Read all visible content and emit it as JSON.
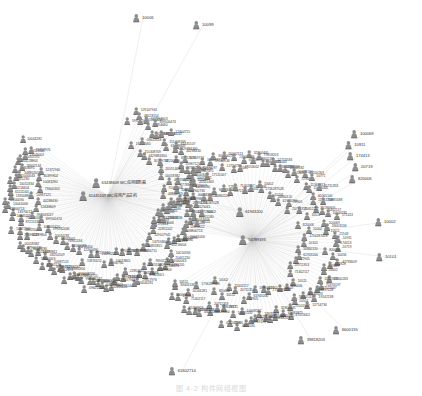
{
  "figure": {
    "caption": "图 4-2  构件网络视图",
    "background_color": "#ffffff",
    "node_color": "#8d8d8d",
    "edge_color": "#c9c9c9",
    "label_color": "#3a3a3a",
    "width": 422,
    "height": 396
  },
  "chart_data": {
    "type": "network-graph",
    "title": "图 4-2  构件网络视图",
    "layout": "two radial hub-and-spoke clusters with peripheral satellites",
    "node_icon": "person-node-icon",
    "hubs": [
      {
        "id": "61445107",
        "label": "61445107  WC应用产品主机",
        "x": 108,
        "y": 196,
        "degree": 120
      },
      {
        "id": "63438609",
        "label": "63438609  WC应用服务器",
        "x": 119,
        "y": 183,
        "degree": 86
      },
      {
        "id": "54789193",
        "label": "54789193",
        "x": 252,
        "y": 240,
        "degree": 112
      },
      {
        "id": "61943200",
        "label": "61943200",
        "x": 249,
        "y": 212,
        "degree": 74
      }
    ],
    "satellites": [
      {
        "id": "10006",
        "x": 143,
        "y": 18
      },
      {
        "id": "10099",
        "x": 203,
        "y": 25
      },
      {
        "id": "100069",
        "x": 362,
        "y": 134
      },
      {
        "id": "10911",
        "x": 355,
        "y": 145
      },
      {
        "id": "174413",
        "x": 358,
        "y": 156
      },
      {
        "id": "20719",
        "x": 362,
        "y": 167
      },
      {
        "id": "820006",
        "x": 360,
        "y": 179
      },
      {
        "id": "10002",
        "x": 385,
        "y": 222
      },
      {
        "id": "10101",
        "x": 386,
        "y": 257
      },
      {
        "id": "6600155",
        "x": 345,
        "y": 330
      },
      {
        "id": "39818203",
        "x": 311,
        "y": 340
      },
      {
        "id": "61602714",
        "x": 182,
        "y": 371
      }
    ],
    "left_cluster_nodes": [
      "599282446",
      "129107941",
      "48023154",
      "105105420",
      "147594603",
      "16354060",
      "399500474",
      "10831815",
      "09601418",
      "998543247",
      "12404715",
      "151408709",
      "63438609",
      "61445107",
      "4429884300",
      "44288430",
      "61312173",
      "30109712",
      "10987125",
      "87501176",
      "48250109",
      "73600343",
      "10073841",
      "20551463",
      "10083280",
      "37900730",
      "00018382",
      "30399804",
      "20090221",
      "48125041",
      "12372940",
      "87215180",
      "71044006",
      "10045205",
      "13370012",
      "43800713",
      "10041006",
      "12200090",
      "13950886",
      "61111163",
      "65218404",
      "10010334",
      "20441230",
      "11000043",
      "34880205",
      "19308091",
      "76902134",
      "63228803",
      "10055170",
      "17043001",
      "13113048",
      "19857976",
      "10044281",
      "22851102",
      "71402117"
    ],
    "right_cluster_nodes": [
      "171413",
      "100069",
      "33003136",
      "10511",
      "21543",
      "10911",
      "174413",
      "20719",
      "820006",
      "10434",
      "47783609",
      "461828",
      "729207",
      "10002",
      "41100263",
      "13307091",
      "75370197",
      "17511007",
      "1756287028",
      "19142138",
      "30140023",
      "12714730",
      "55002113",
      "10101",
      "17001567",
      "47053002",
      "69465875",
      "32804405",
      "16860120",
      "79818203",
      "6600155",
      "74835003",
      "52713533",
      "61943200",
      "54789193",
      "10008182",
      "4022030",
      "10681550",
      "72905",
      "41100263",
      "10771",
      "11367812",
      "11028000",
      "20711353",
      "40065100",
      "11914738",
      "20885588",
      "35199909",
      "71402117",
      "10144281"
    ]
  }
}
